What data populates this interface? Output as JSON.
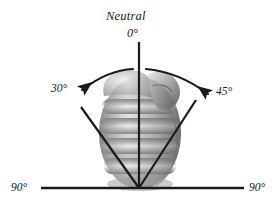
{
  "figure": {
    "panel_label": "B.",
    "topic": "wrist-range-of-motion-radial-ulnar-deviation",
    "background_color": "#ffffff",
    "line_color": "#1a1a1a",
    "labels": {
      "neutral_word": "Neutral",
      "neutral_degrees": "0°",
      "left_deviation": "30°",
      "right_deviation": "45°",
      "baseline_left": "90°",
      "baseline_right": "90°"
    },
    "illustration": {
      "subject": "clenched-fist-dorsal-view",
      "style": "grayscale-airbrush-shaded",
      "finger_ridges": 4
    },
    "geometry": {
      "apex": [
        139,
        188
      ],
      "neutral_line_top": [
        139,
        42
      ],
      "left_ray_end": [
        81,
        107
      ],
      "right_ray_end": [
        196,
        100
      ],
      "baseline_start": [
        41,
        188
      ],
      "baseline_end": [
        244,
        188
      ],
      "left_arrow_tip": [
        78,
        92
      ],
      "right_arrow_tip": [
        212,
        96
      ]
    }
  }
}
